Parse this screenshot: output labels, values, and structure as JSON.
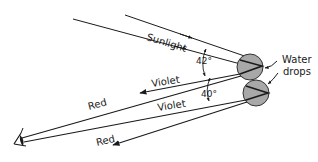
{
  "diagram": {
    "type": "rainbow-formation",
    "colors": {
      "line": "#1a1a1a",
      "drop_fill": "#a8a8a8",
      "drop_stroke": "#333333",
      "background": "#ffffff"
    },
    "labels": {
      "sunlight": "Sunlight",
      "water_drops_line1": "Water",
      "water_drops_line2": "drops",
      "violet_upper": "Violet",
      "violet_lower": "Violet",
      "red_upper": "Red",
      "red_lower": "Red",
      "angle_upper": "42°",
      "angle_lower": "40°"
    },
    "elements": {
      "drops": [
        {
          "name": "upper-drop",
          "cx": 250,
          "cy": 67,
          "r": 13
        },
        {
          "name": "lower-drop",
          "cx": 256,
          "cy": 93,
          "r": 13
        }
      ],
      "observer": {
        "name": "eye",
        "x": 20,
        "y": 140
      }
    }
  }
}
